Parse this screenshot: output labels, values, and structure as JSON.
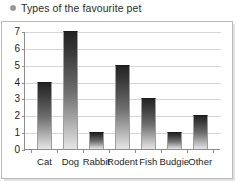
{
  "title": {
    "text": "Types of the favourite pet",
    "bullet_icon": "bullet-dot-icon",
    "bullet_color": "#9a9a9a"
  },
  "chart_data": {
    "type": "bar",
    "title": "Types of the favourite pet",
    "xlabel": "",
    "ylabel": "",
    "categories": [
      "Cat",
      "Dog",
      "Rabbit",
      "Rodent",
      "Fish",
      "Budgie",
      "Other"
    ],
    "values": [
      4,
      7,
      1,
      5,
      3,
      1,
      2
    ],
    "ylim": [
      0,
      7
    ],
    "yticks": [
      0,
      1,
      2,
      3,
      4,
      5,
      6,
      7
    ],
    "ytick_labels": [
      "0",
      "1",
      "2",
      "3",
      "4",
      "5",
      "6",
      "7"
    ],
    "grid": true,
    "grid_axis": "y",
    "legend": false,
    "bar_fill": "vertical-gradient-dark-to-light",
    "bar_color_top": "#232323",
    "bar_color_bottom": "#e6e6e6",
    "gridline_color": "#d6d6d6",
    "axis_color": "#8d8d8d",
    "frame_color": "#b9b9b9",
    "text_color": "#1d1d1d",
    "background": "#ffffff"
  }
}
